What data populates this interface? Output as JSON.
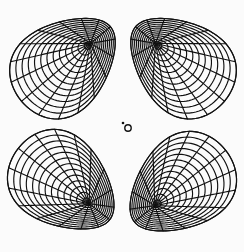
{
  "canvas": {
    "width": 244,
    "height": 252,
    "background": "#fbfbfb",
    "stroke": "#111111"
  },
  "center_marker": {
    "label": "o",
    "cx": 128,
    "cy": 128,
    "r": 3.2,
    "dot": {
      "cx": 123,
      "cy": 123,
      "r": 1.3
    }
  },
  "lobes": [
    {
      "name": "upper-left",
      "cx": 66,
      "cy": 64,
      "rx": 58,
      "ry": 44,
      "rotation": -40,
      "tip": [
        118,
        100
      ],
      "mesh_u": 13,
      "mesh_v": 16
    },
    {
      "name": "upper-right",
      "cx": 180,
      "cy": 64,
      "rx": 58,
      "ry": 44,
      "rotation": 40,
      "tip": [
        126,
        100
      ],
      "mesh_u": 13,
      "mesh_v": 16
    },
    {
      "name": "lower-left",
      "cx": 64,
      "cy": 184,
      "rx": 58,
      "ry": 44,
      "rotation": 38,
      "tip": [
        118,
        150
      ],
      "mesh_u": 13,
      "mesh_v": 16
    },
    {
      "name": "lower-right",
      "cx": 180,
      "cy": 186,
      "rx": 58,
      "ry": 44,
      "rotation": -38,
      "tip": [
        126,
        150
      ],
      "mesh_u": 13,
      "mesh_v": 16
    }
  ]
}
